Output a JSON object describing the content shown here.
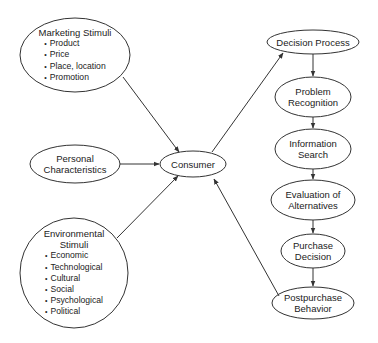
{
  "colors": {
    "stroke": "#333333",
    "background": "#ffffff",
    "text": "#222222"
  },
  "nodes": {
    "marketing": {
      "title": "Marketing Stimuli",
      "bullets": [
        "Product",
        "Price",
        "Place, location",
        "Promotion"
      ]
    },
    "personal": {
      "line1": "Personal",
      "line2": "Characteristics"
    },
    "environmental": {
      "line1": "Environmental",
      "line2": "Stimuli",
      "bullets": [
        "Economic",
        "Technological",
        "Cultural",
        "Social",
        "Psychological",
        "Political"
      ]
    },
    "consumer": {
      "title": "Consumer"
    },
    "decision_process": {
      "title": "Decision Process"
    },
    "problem_recognition": {
      "line1": "Problem",
      "line2": "Recognition"
    },
    "information_search": {
      "line1": "Information",
      "line2": "Search"
    },
    "evaluation": {
      "line1": "Evaluation of",
      "line2": "Alternatives"
    },
    "purchase_decision": {
      "line1": "Purchase",
      "line2": "Decision"
    },
    "postpurchase": {
      "line1": "Postpurchase",
      "line2": "Behavior"
    }
  },
  "edges": [
    {
      "from": "Marketing Stimuli",
      "to": "Consumer"
    },
    {
      "from": "Personal Characteristics",
      "to": "Consumer"
    },
    {
      "from": "Environmental Stimuli",
      "to": "Consumer"
    },
    {
      "from": "Consumer",
      "to": "Decision Process"
    },
    {
      "from": "Decision Process",
      "to": "Problem Recognition"
    },
    {
      "from": "Problem Recognition",
      "to": "Information Search"
    },
    {
      "from": "Information Search",
      "to": "Evaluation of Alternatives"
    },
    {
      "from": "Evaluation of Alternatives",
      "to": "Purchase Decision"
    },
    {
      "from": "Purchase Decision",
      "to": "Postpurchase Behavior"
    },
    {
      "from": "Postpurchase Behavior",
      "to": "Consumer"
    }
  ]
}
